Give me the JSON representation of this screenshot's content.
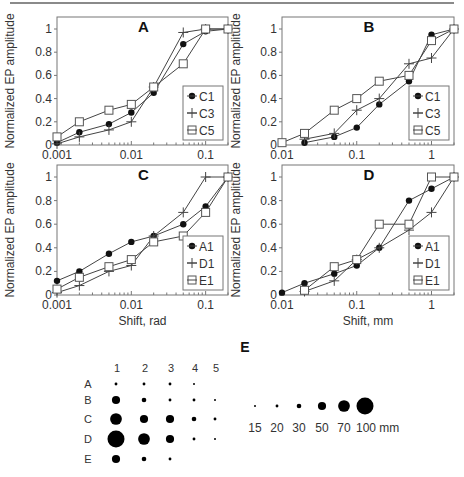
{
  "chart_data": [
    {
      "id": "A",
      "type": "line",
      "title": "A",
      "xlabel": "",
      "ylabel": "Normalized EP amplitude",
      "xscale": "log",
      "xlim": [
        0.001,
        0.2
      ],
      "ylim": [
        0,
        1.05
      ],
      "xticks": [
        0.001,
        0.01,
        0.1
      ],
      "xtick_labels": [
        "0.001",
        "0.01",
        "0.1"
      ],
      "yticks": [
        0,
        0.2,
        0.4,
        0.6,
        0.8,
        1
      ],
      "ytick_labels": [
        "0",
        "0.2",
        "0.4",
        "0.6",
        "0.8",
        "1"
      ],
      "legend_position": "bottom-right",
      "x": [
        0.001,
        0.002,
        0.005,
        0.01,
        0.02,
        0.05,
        0.1,
        0.2
      ],
      "series": [
        {
          "name": "C1",
          "marker": "dot",
          "values": [
            0.02,
            0.11,
            0.18,
            0.28,
            0.45,
            0.87,
            0.98,
            1.0
          ]
        },
        {
          "name": "C3",
          "marker": "plus",
          "values": [
            0.01,
            0.07,
            0.13,
            0.2,
            0.5,
            0.97,
            1.0,
            1.0
          ]
        },
        {
          "name": "C5",
          "marker": "square",
          "values": [
            0.07,
            0.2,
            0.3,
            0.35,
            0.5,
            0.7,
            1.0,
            1.0
          ]
        }
      ]
    },
    {
      "id": "B",
      "type": "line",
      "title": "B",
      "xlabel": "",
      "ylabel": "Normalized EP amplitude",
      "xscale": "log",
      "xlim": [
        0.01,
        2
      ],
      "ylim": [
        0,
        1.05
      ],
      "xticks": [
        0.01,
        0.1,
        1
      ],
      "xtick_labels": [
        "0.01",
        "0.1",
        "1"
      ],
      "yticks": [
        0,
        0.2,
        0.4,
        0.6,
        0.8,
        1
      ],
      "ytick_labels": [
        "0",
        "0.2",
        "0.4",
        "0.6",
        "0.8",
        "1"
      ],
      "legend_position": "bottom-right",
      "x": [
        0.01,
        0.02,
        0.05,
        0.1,
        0.2,
        0.5,
        1,
        2
      ],
      "series": [
        {
          "name": "C1",
          "marker": "dot",
          "values": [
            null,
            0.02,
            0.07,
            0.15,
            0.35,
            0.55,
            0.95,
            1.0
          ]
        },
        {
          "name": "C3",
          "marker": "plus",
          "values": [
            null,
            0.05,
            0.1,
            0.3,
            0.4,
            0.7,
            0.75,
            1.0
          ]
        },
        {
          "name": "C5",
          "marker": "square",
          "values": [
            0.02,
            0.1,
            0.3,
            0.4,
            0.55,
            0.6,
            0.9,
            1.0
          ]
        }
      ]
    },
    {
      "id": "C",
      "type": "line",
      "title": "C",
      "xlabel": "Shift, rad",
      "ylabel": "Normalized EP amplitude",
      "xscale": "log",
      "xlim": [
        0.001,
        0.2
      ],
      "ylim": [
        0,
        1.05
      ],
      "xticks": [
        0.001,
        0.01,
        0.1
      ],
      "xtick_labels": [
        "0.001",
        "0.01",
        "0.1"
      ],
      "yticks": [
        0,
        0.2,
        0.4,
        0.6,
        0.8,
        1
      ],
      "ytick_labels": [
        "0",
        "0.2",
        "0.4",
        "0.6",
        "0.8",
        "1"
      ],
      "legend_position": "bottom-right",
      "x": [
        0.001,
        0.002,
        0.005,
        0.01,
        0.02,
        0.05,
        0.1,
        0.2
      ],
      "series": [
        {
          "name": "A1",
          "marker": "dot",
          "values": [
            0.12,
            0.2,
            0.35,
            0.45,
            0.5,
            0.6,
            0.75,
            1.0
          ]
        },
        {
          "name": "D1",
          "marker": "plus",
          "values": [
            0.02,
            0.08,
            0.2,
            0.25,
            0.5,
            0.7,
            1.0,
            1.0
          ]
        },
        {
          "name": "E1",
          "marker": "square",
          "values": [
            0.05,
            0.15,
            0.24,
            0.3,
            0.45,
            0.5,
            0.7,
            1.0
          ]
        }
      ]
    },
    {
      "id": "D",
      "type": "line",
      "title": "D",
      "xlabel": "Shift, mm",
      "ylabel": "Normalized EP amplitude",
      "xscale": "log",
      "xlim": [
        0.01,
        2
      ],
      "ylim": [
        0,
        1.05
      ],
      "xticks": [
        0.01,
        0.1,
        1
      ],
      "xtick_labels": [
        "0.01",
        "0.1",
        "1"
      ],
      "yticks": [
        0,
        0.2,
        0.4,
        0.6,
        0.8,
        1
      ],
      "ytick_labels": [
        "0",
        "0.2",
        "0.4",
        "0.6",
        "0.8",
        "1"
      ],
      "legend_position": "bottom-right",
      "x": [
        0.01,
        0.02,
        0.05,
        0.1,
        0.2,
        0.5,
        1,
        2
      ],
      "series": [
        {
          "name": "A1",
          "marker": "dot",
          "values": [
            0.02,
            0.1,
            0.18,
            0.25,
            0.4,
            0.8,
            0.9,
            1.0
          ]
        },
        {
          "name": "D1",
          "marker": "plus",
          "values": [
            null,
            0.03,
            0.12,
            0.3,
            0.4,
            0.55,
            0.7,
            1.0
          ]
        },
        {
          "name": "E1",
          "marker": "square",
          "values": [
            null,
            0.04,
            0.24,
            0.3,
            0.6,
            0.6,
            1.0,
            1.0
          ]
        }
      ]
    },
    {
      "id": "E",
      "type": "bubble-grid",
      "title": "E",
      "columns": [
        "1",
        "2",
        "3",
        "4",
        "5"
      ],
      "rows": [
        "A",
        "B",
        "C",
        "D",
        "E"
      ],
      "values_mm": [
        [
          20,
          20,
          20,
          15,
          null
        ],
        [
          50,
          30,
          20,
          20,
          15
        ],
        [
          70,
          50,
          50,
          30,
          20
        ],
        [
          100,
          70,
          50,
          20,
          15
        ],
        [
          50,
          30,
          20,
          null,
          null
        ]
      ],
      "scale_legend": {
        "values": [
          15,
          20,
          30,
          50,
          70,
          100
        ],
        "labels": [
          "15",
          "20",
          "30",
          "50",
          "70",
          "100 mm"
        ]
      }
    }
  ]
}
